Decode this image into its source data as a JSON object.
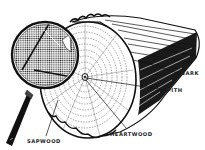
{
  "diagram": {
    "labels": {
      "bark": "BARK",
      "pith": "PITH",
      "heartwood": "HEARTWOOD",
      "sapwood": "SAPWOOD"
    },
    "colors": {
      "ink": "#111111",
      "paper": "#ffffff",
      "label": "#222222"
    }
  }
}
